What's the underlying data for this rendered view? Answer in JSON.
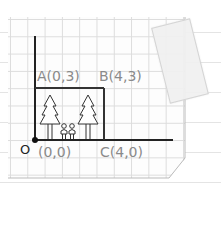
{
  "diagram": {
    "points": [
      {
        "name": "A",
        "label": "A(0,3)",
        "x": 0,
        "y": 3
      },
      {
        "name": "B",
        "label": "B(4,3)",
        "x": 4,
        "y": 3
      },
      {
        "name": "C",
        "label": "C(4,0)",
        "x": 4,
        "y": 0
      },
      {
        "name": "O",
        "label": "(0,0)",
        "x": 0,
        "y": 0
      }
    ],
    "origin_letter": "O",
    "labels": {
      "a": "A(0,3)",
      "b": "B(4,3)",
      "c": "C(4,0)",
      "origin_coords": "(0,0)",
      "origin": "O"
    },
    "decorations": [
      "pine-tree",
      "pine-tree",
      "person",
      "person",
      "tape",
      "grid-paper"
    ],
    "colors": {
      "axis": "#222222",
      "label": "#8a8a8a",
      "grid": "#dcdcdc",
      "paper": "#fdfdfd"
    }
  }
}
